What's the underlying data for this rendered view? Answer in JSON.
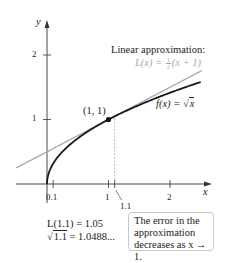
{
  "chart_data": {
    "type": "line",
    "title": "",
    "xlabel": "x",
    "ylabel": "y",
    "xlim": [
      -0.5,
      2.7
    ],
    "ylim": [
      0,
      2.3
    ],
    "grid": false,
    "x_ticks": [
      {
        "value": 0.1,
        "label": "0.1"
      },
      {
        "value": 1,
        "label": "1"
      },
      {
        "value": 1.1,
        "label": "1.1"
      },
      {
        "value": 2,
        "label": "2"
      }
    ],
    "y_ticks": [
      {
        "value": 1,
        "label": "1"
      },
      {
        "value": 2,
        "label": "2"
      }
    ],
    "series": [
      {
        "name": "f(x) = √x",
        "function": "sqrt(x)",
        "x_range": [
          0,
          2.5
        ],
        "color": "#1a1a1a"
      },
      {
        "name": "L(x) = ½(x + 1)",
        "function": "(x+1)/2",
        "x_range": [
          -0.5,
          2.52
        ],
        "color": "#a8a8a8"
      }
    ],
    "points": [
      {
        "x": 1,
        "y": 1,
        "label": "(1, 1)"
      }
    ],
    "reference_lines": [
      {
        "type": "vertical-dashed",
        "x": 1.1
      }
    ],
    "annotations": {
      "linear_title": "Linear approximation:",
      "linear_formula_lhs": "L(x) = ",
      "linear_formula_num": "1",
      "linear_formula_den": "2",
      "linear_formula_rhs": "(x + 1)",
      "f_label_lhs": "f(x) = ",
      "f_label_radical": "√",
      "f_label_radicand": "x",
      "point_label": "(1, 1)",
      "l_value": "L(1.1) = 1.05",
      "sqrt_value_radical": "√",
      "sqrt_value_radicand": "1.1",
      "sqrt_value_rhs": " = 1.0488...",
      "note_lines": [
        "The error in the",
        "approximation",
        "decreases as x → 1."
      ]
    }
  }
}
